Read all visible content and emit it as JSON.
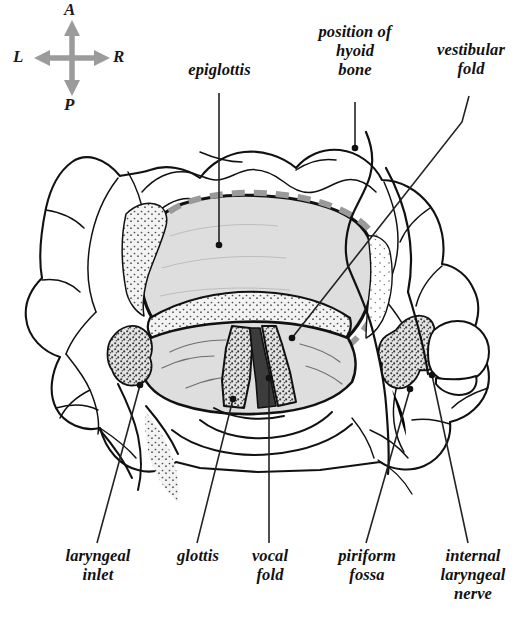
{
  "figure": {
    "colors": {
      "ink": "#111111",
      "mucosa_fill": "#dedede",
      "stipple": "#555555",
      "inlet_dashed": "#9a9a9a",
      "compass_arrow": "#9b9b9b",
      "background": "#ffffff"
    }
  },
  "compass": {
    "anterior": "A",
    "posterior": "P",
    "left": "L",
    "right": "R"
  },
  "labels": {
    "epiglottis": "epiglottis",
    "hyoid": "position of\nhyoid\nbone",
    "vestibular_fold": "vestibular\nfold",
    "laryngeal_inlet": "laryngeal\ninlet",
    "glottis": "glottis",
    "vocal_fold": "vocal\nfold",
    "piriform_fossa": "piriform\nfossa",
    "internal_laryngeal_nerve": "internal\nlaryngeal\nnerve"
  }
}
